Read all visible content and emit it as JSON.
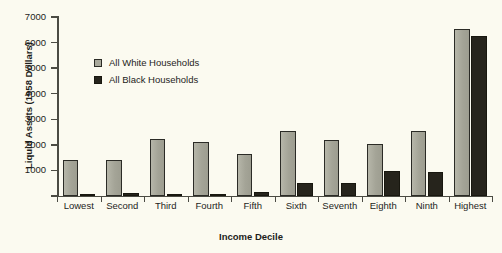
{
  "chart_data": {
    "type": "bar",
    "title": "",
    "xlabel": "Income Decile",
    "ylabel": "Liquid Assets (1958 Dollars)",
    "categories": [
      "Lowest",
      "Second",
      "Third",
      "Fourth",
      "Fifth",
      "Sixth",
      "Seventh",
      "Eighth",
      "Ninth",
      "Highest"
    ],
    "series": [
      {
        "name": "All White Households",
        "color": "#a9a99c",
        "values": [
          1400,
          1420,
          2230,
          2130,
          1630,
          2530,
          2180,
          2050,
          2530,
          6550
        ]
      },
      {
        "name": "All Black Households",
        "color": "#26241c",
        "values": [
          30,
          100,
          70,
          80,
          150,
          490,
          520,
          980,
          920,
          6260
        ]
      }
    ],
    "ylim": [
      0,
      7000
    ],
    "yticks": [
      0,
      1000,
      2000,
      3000,
      4000,
      5000,
      6000,
      7000
    ],
    "ytick_labels": [
      "",
      "1000",
      "2000",
      "3000",
      "4000",
      "5000",
      "6000",
      "7000"
    ],
    "grid": false,
    "legend_position": "inside-upper-left",
    "background": "#fbfaf0",
    "axis_color": "#4b4b43"
  },
  "legend": {
    "items": [
      {
        "label": "All White Households",
        "swatch": "white-square-icon"
      },
      {
        "label": "All Black Households",
        "swatch": "black-square-icon"
      }
    ]
  }
}
